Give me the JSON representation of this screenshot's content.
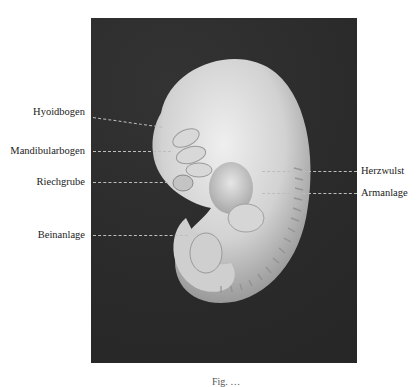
{
  "figure": {
    "type": "embryo-photograph",
    "background_color": "#2b2b2b",
    "subject_color": "#dcdcdc",
    "labels_left": [
      {
        "text": "Hyoidbogen",
        "y": 112
      },
      {
        "text": "Mandibularbogen",
        "y": 151
      },
      {
        "text": "Riechgrube",
        "y": 182
      },
      {
        "text": "Beinanlage",
        "y": 235
      }
    ],
    "labels_right": [
      {
        "text": "Herzwulst",
        "y": 170
      },
      {
        "text": "Armanlage",
        "y": 193
      }
    ],
    "caption": "Fig. …"
  }
}
